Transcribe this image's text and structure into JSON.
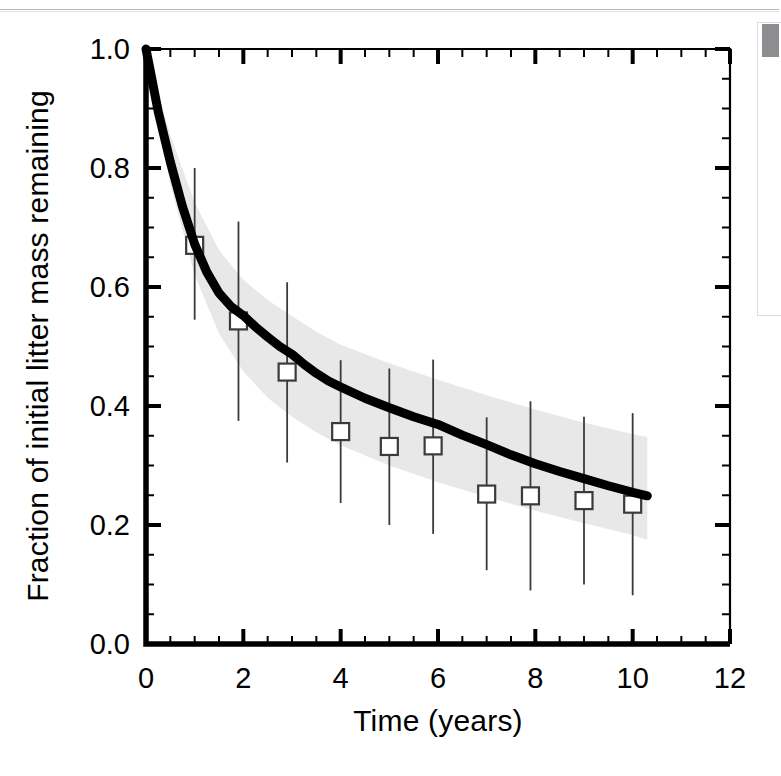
{
  "figure": {
    "background_color": "#ffffff",
    "page_rule_color": "#b9b9bd"
  },
  "right_panel": {
    "scrollbar_thumb_color": "#8d8d91",
    "panel_border_color": "#dcdce0"
  },
  "chart_data": {
    "type": "line",
    "title": "",
    "subtitle": "",
    "xlabel": "Time (years)",
    "ylabel": "Fraction of initial litter mass remaining",
    "xlim": [
      0,
      12
    ],
    "ylim": [
      0.0,
      1.0
    ],
    "grid": false,
    "legend": "none",
    "x_major_ticks": [
      0,
      2,
      4,
      6,
      8,
      10,
      12
    ],
    "x_major_tick_labels": [
      "0",
      "2",
      "4",
      "6",
      "8",
      "10",
      "12"
    ],
    "x_minor_tick_step": 0.5,
    "y_major_ticks": [
      0.0,
      0.2,
      0.4,
      0.6,
      0.8,
      1.0
    ],
    "y_major_tick_labels": [
      "0.0",
      "0.2",
      "0.4",
      "0.6",
      "0.8",
      "1.0"
    ],
    "y_minor_tick_step": 0.05,
    "tick_direction": "in",
    "series": [
      {
        "name": "Modeled mass remaining",
        "style": "thick-black-line",
        "color": "#000000",
        "line_width_px": 9,
        "x": [
          0,
          0.25,
          0.5,
          0.75,
          1.0,
          1.25,
          1.5,
          1.75,
          2.0,
          2.25,
          2.5,
          2.75,
          3.0,
          3.25,
          3.5,
          3.75,
          4.0,
          4.5,
          5.0,
          5.5,
          6.0,
          6.5,
          7.0,
          7.5,
          8.0,
          8.5,
          9.0,
          9.5,
          10.0,
          10.3
        ],
        "y": [
          1.0,
          0.895,
          0.81,
          0.735,
          0.672,
          0.625,
          0.59,
          0.567,
          0.552,
          0.533,
          0.516,
          0.5,
          0.487,
          0.47,
          0.455,
          0.442,
          0.432,
          0.413,
          0.397,
          0.382,
          0.369,
          0.351,
          0.335,
          0.318,
          0.303,
          0.29,
          0.278,
          0.266,
          0.255,
          0.249
        ]
      },
      {
        "name": "Model uncertainty band (upper bound)",
        "style": "shaded-band",
        "color": "#e8e8e8",
        "x": [
          0,
          0.5,
          1.0,
          1.5,
          2.0,
          2.5,
          3.0,
          3.5,
          4.0,
          5.0,
          6.0,
          7.0,
          8.0,
          9.0,
          10.0,
          10.3
        ],
        "y": [
          1.0,
          0.855,
          0.742,
          0.662,
          0.612,
          0.578,
          0.551,
          0.525,
          0.503,
          0.472,
          0.444,
          0.418,
          0.394,
          0.372,
          0.353,
          0.348
        ]
      },
      {
        "name": "Model uncertainty band (lower bound)",
        "style": "shaded-band",
        "color": "#e8e8e8",
        "x": [
          0,
          0.5,
          1.0,
          1.5,
          2.0,
          2.5,
          3.0,
          3.5,
          4.0,
          5.0,
          6.0,
          7.0,
          8.0,
          9.0,
          10.0,
          10.3
        ],
        "y": [
          1.0,
          0.772,
          0.62,
          0.522,
          0.458,
          0.414,
          0.382,
          0.356,
          0.334,
          0.3,
          0.272,
          0.247,
          0.224,
          0.203,
          0.183,
          0.175
        ]
      }
    ],
    "observations": {
      "name": "Observed litter mass remaining",
      "marker": "open-square",
      "marker_size_px": 17,
      "marker_edge_color": "#3a3a3a",
      "marker_face_color": "#ffffff",
      "error_bar_color": "#3a3a3a",
      "points": [
        {
          "x": 1.0,
          "y": 0.67,
          "err_low": 0.545,
          "err_high": 0.8
        },
        {
          "x": 1.9,
          "y": 0.543,
          "err_low": 0.375,
          "err_high": 0.71
        },
        {
          "x": 2.9,
          "y": 0.457,
          "err_low": 0.305,
          "err_high": 0.608
        },
        {
          "x": 4.0,
          "y": 0.357,
          "err_low": 0.237,
          "err_high": 0.477
        },
        {
          "x": 5.0,
          "y": 0.332,
          "err_low": 0.2,
          "err_high": 0.463
        },
        {
          "x": 5.9,
          "y": 0.333,
          "err_low": 0.185,
          "err_high": 0.478
        },
        {
          "x": 7.0,
          "y": 0.252,
          "err_low": 0.124,
          "err_high": 0.381
        },
        {
          "x": 7.9,
          "y": 0.249,
          "err_low": 0.09,
          "err_high": 0.408
        },
        {
          "x": 9.0,
          "y": 0.241,
          "err_low": 0.1,
          "err_high": 0.382
        },
        {
          "x": 10.0,
          "y": 0.235,
          "err_low": 0.082,
          "err_high": 0.388
        }
      ]
    }
  }
}
